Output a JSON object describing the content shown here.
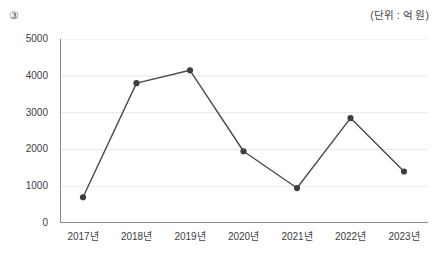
{
  "header": {
    "item_number": "③",
    "unit_label": "(단위 : 억 원)"
  },
  "chart_data": {
    "type": "line",
    "title": "",
    "subtitle": "",
    "xlabel": "",
    "ylabel": "",
    "unit": "억 원",
    "categories": [
      "2017년",
      "2018년",
      "2019년",
      "2020년",
      "2021년",
      "2022년",
      "2023년"
    ],
    "values": [
      700,
      3800,
      4150,
      1950,
      950,
      2850,
      1400
    ],
    "series": [
      {
        "name": "금액",
        "values": [
          700,
          3800,
          4150,
          1950,
          950,
          2850,
          1400
        ]
      }
    ],
    "yticks": [
      "0",
      "1000",
      "2000",
      "3000",
      "4000",
      "5000"
    ],
    "ytick_values": [
      0,
      1000,
      2000,
      3000,
      4000,
      5000
    ],
    "ylim": [
      0,
      5000
    ],
    "grid": true,
    "grid_axis": "y",
    "legend": false,
    "legend_position": "none",
    "marker": "circle",
    "line_color": "#4a4a4a",
    "marker_color": "#3f3f3f",
    "grid_color": "#e8e8e8",
    "axis_color": "#8a8a8a"
  }
}
